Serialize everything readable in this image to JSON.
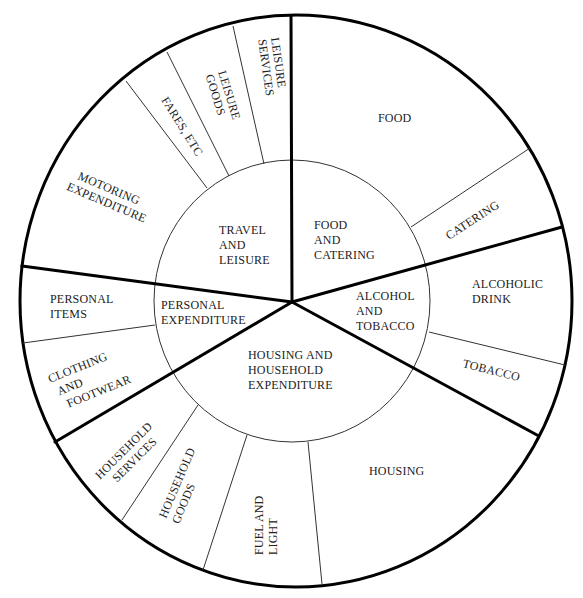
{
  "diagram": {
    "type": "nested pie / sunburst diagram",
    "inner_categories": [
      {
        "id": "food-and-catering",
        "lines": [
          "FOOD",
          "AND",
          "CATERING"
        ]
      },
      {
        "id": "alcohol-and-tobacco",
        "lines": [
          "ALCOHOL",
          "AND",
          "TOBACCO"
        ]
      },
      {
        "id": "housing-and-household",
        "lines": [
          "HOUSING AND",
          "HOUSEHOLD",
          "EXPENDITURE"
        ]
      },
      {
        "id": "personal-expenditure",
        "lines": [
          "PERSONAL",
          "EXPENDITURE"
        ]
      },
      {
        "id": "travel-and-leisure",
        "lines": [
          "TRAVEL",
          "AND",
          "LEISURE"
        ]
      }
    ],
    "outer_segments": [
      {
        "id": "food",
        "parent": "food-and-catering",
        "lines": [
          "FOOD"
        ]
      },
      {
        "id": "catering",
        "parent": "food-and-catering",
        "lines": [
          "CATERING"
        ]
      },
      {
        "id": "alcoholic-drink",
        "parent": "alcohol-and-tobacco",
        "lines": [
          "ALCOHOLIC",
          "DRINK"
        ]
      },
      {
        "id": "tobacco",
        "parent": "alcohol-and-tobacco",
        "lines": [
          "TOBACCO"
        ]
      },
      {
        "id": "housing",
        "parent": "housing-and-household",
        "lines": [
          "HOUSING"
        ]
      },
      {
        "id": "fuel-and-light",
        "parent": "housing-and-household",
        "lines": [
          "FUEL AND",
          "LIGHT"
        ]
      },
      {
        "id": "household-goods",
        "parent": "housing-and-household",
        "lines": [
          "HOUSEHOLD",
          "GOODS"
        ]
      },
      {
        "id": "household-services",
        "parent": "housing-and-household",
        "lines": [
          "HOUSEHOLD",
          "SERVICES"
        ]
      },
      {
        "id": "clothing-and-footwear",
        "parent": "personal-expenditure",
        "lines": [
          "CLOTHING",
          "AND",
          "FOOTWEAR"
        ]
      },
      {
        "id": "personal-items",
        "parent": "personal-expenditure",
        "lines": [
          "PERSONAL",
          "ITEMS"
        ]
      },
      {
        "id": "motoring-expenditure",
        "parent": "travel-and-leisure",
        "lines": [
          "MOTORING",
          "EXPENDITURE"
        ]
      },
      {
        "id": "fares-etc",
        "parent": "travel-and-leisure",
        "lines": [
          "FARES, ETC"
        ]
      },
      {
        "id": "leisure-goods",
        "parent": "travel-and-leisure",
        "lines": [
          "LEISURE",
          "GOODS"
        ]
      },
      {
        "id": "leisure-services",
        "parent": "travel-and-leisure",
        "lines": [
          "LEISURE",
          "SERVICES"
        ]
      }
    ]
  },
  "labels": {
    "food_catering": [
      "FOOD",
      "AND",
      "CATERING"
    ],
    "alcohol_tobacco": [
      "ALCOHOL",
      "AND",
      "TOBACCO"
    ],
    "housing_household": [
      "HOUSING AND",
      "HOUSEHOLD",
      "EXPENDITURE"
    ],
    "personal_expenditure": [
      "PERSONAL",
      "EXPENDITURE"
    ],
    "travel_leisure": [
      "TRAVEL",
      "AND",
      "LEISURE"
    ],
    "food": [
      "FOOD"
    ],
    "catering": [
      "CATERING"
    ],
    "alcoholic_drink": [
      "ALCOHOLIC",
      "DRINK"
    ],
    "tobacco": [
      "TOBACCO"
    ],
    "housing": [
      "HOUSING"
    ],
    "fuel_light": [
      "FUEL AND",
      "LIGHT"
    ],
    "household_goods": [
      "HOUSEHOLD",
      "GOODS"
    ],
    "household_services": [
      "HOUSEHOLD",
      "SERVICES"
    ],
    "clothing_footwear": [
      "CLOTHING",
      "AND",
      "FOOTWEAR"
    ],
    "personal_items": [
      "PERSONAL",
      "ITEMS"
    ],
    "motoring": [
      "MOTORING",
      "EXPENDITURE"
    ],
    "fares": [
      "FARES, ETC"
    ],
    "leisure_goods": [
      "LEISURE",
      "GOODS"
    ],
    "leisure_services": [
      "LEISURE",
      "SERVICES"
    ]
  }
}
